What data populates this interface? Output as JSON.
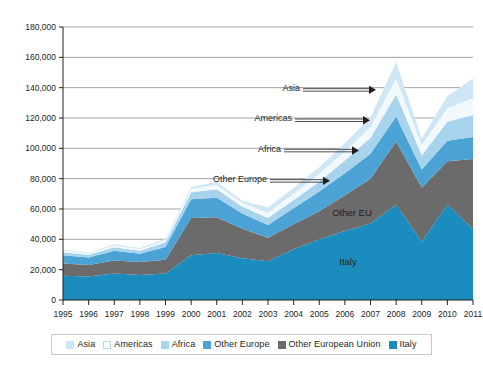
{
  "chart_data": {
    "type": "area",
    "stacked": true,
    "title": "",
    "subtitle": "",
    "xlabel": "",
    "ylabel": "",
    "grid": true,
    "legend_position": "bottom",
    "xlim": [
      1995,
      2011
    ],
    "ylim": [
      0,
      180000
    ],
    "ytick_step": 20000,
    "categories": [
      "1995",
      "1996",
      "1997",
      "1998",
      "1999",
      "2000",
      "2001",
      "2002",
      "2003",
      "2004",
      "2005",
      "2006",
      "2007",
      "2008",
      "2009",
      "2010",
      "2011"
    ],
    "ytick_labels": [
      "0",
      "20,000",
      "40,000",
      "60,000",
      "80,000",
      "100,000",
      "120,000",
      "140,000",
      "160,000",
      "180,000"
    ],
    "ytick_values": [
      0,
      20000,
      40000,
      60000,
      80000,
      100000,
      120000,
      140000,
      160000,
      180000
    ],
    "series": [
      {
        "name": "Italy",
        "color": "#1b8cbe",
        "values": [
          16000,
          15500,
          17500,
          16500,
          17500,
          29500,
          31000,
          27500,
          25500,
          33500,
          40000,
          45500,
          50500,
          63000,
          38500,
          63000,
          47000
        ]
      },
      {
        "name": "Other European Union",
        "color": "#6b6b6b",
        "values": [
          8000,
          7500,
          8500,
          8500,
          9000,
          24500,
          23500,
          19500,
          15500,
          16500,
          18500,
          23500,
          29500,
          41500,
          35500,
          28500,
          46000
        ]
      },
      {
        "name": "Other Europe",
        "color": "#4aa3d4",
        "values": [
          5500,
          5000,
          6500,
          5500,
          8500,
          12500,
          13000,
          10000,
          8500,
          10500,
          13000,
          14500,
          16500,
          16500,
          12000,
          13500,
          14500
        ]
      },
      {
        "name": "Africa",
        "color": "#a8d3ec",
        "values": [
          2000,
          1800,
          2200,
          2000,
          3000,
          4500,
          5500,
          4500,
          4500,
          5500,
          6500,
          8500,
          10500,
          14500,
          9500,
          12500,
          14500
        ]
      },
      {
        "name": "Americas",
        "color": "#f2f9fd",
        "values": [
          1000,
          1000,
          1200,
          1100,
          1500,
          2200,
          3000,
          2500,
          3500,
          4000,
          5000,
          6000,
          7000,
          10500,
          6500,
          9000,
          11000
        ]
      },
      {
        "name": "Asia",
        "color": "#cfe7f5",
        "values": [
          600,
          600,
          800,
          700,
          1000,
          1300,
          1800,
          1500,
          3500,
          4000,
          4500,
          5500,
          6500,
          11000,
          4500,
          8000,
          13000
        ]
      }
    ],
    "totals": [
      33100,
      31400,
      36700,
      34300,
      40500,
      74500,
      77800,
      65500,
      61000,
      74000,
      87500,
      103500,
      120500,
      157000,
      106500,
      134500,
      146000
    ],
    "annotations": [
      {
        "label": "Asia",
        "gridline_value": 140000
      },
      {
        "label": "Americas",
        "gridline_value": 120000
      },
      {
        "label": "Africa",
        "gridline_value": 100000
      },
      {
        "label": "Other Europe",
        "gridline_value": 80000
      }
    ],
    "inline_labels": [
      {
        "label": "Other EU",
        "series": "Other European Union"
      },
      {
        "label": "Italy",
        "series": "Italy"
      }
    ]
  },
  "legend": {
    "items": [
      {
        "label": "Asia",
        "color": "#cfe7f5"
      },
      {
        "label": "Americas",
        "color": "#fbfdfe"
      },
      {
        "label": "Africa",
        "color": "#a8d3ec"
      },
      {
        "label": "Other Europe",
        "color": "#4aa3d4"
      },
      {
        "label": "Other European Union",
        "color": "#6b6b6b"
      },
      {
        "label": "Italy",
        "color": "#1b8cbe"
      }
    ]
  }
}
